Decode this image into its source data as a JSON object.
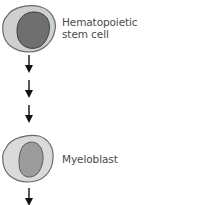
{
  "diagram": {
    "type": "cell-lineage",
    "stages": [
      {
        "id": "hsc",
        "label_lines": [
          "Hematopoietic",
          "stem cell"
        ],
        "cytoplasm_color": "#c9c9c9",
        "nucleus_color": "#6e6e6e"
      },
      {
        "id": "myeloblast",
        "label_lines": [
          "Myeloblast"
        ],
        "cytoplasm_color": "#d6d6d6",
        "nucleus_color": "#9a9a9a"
      }
    ],
    "arrows": {
      "between_stages": 3,
      "after_last": 1,
      "direction": "down",
      "color": "#111111"
    }
  }
}
